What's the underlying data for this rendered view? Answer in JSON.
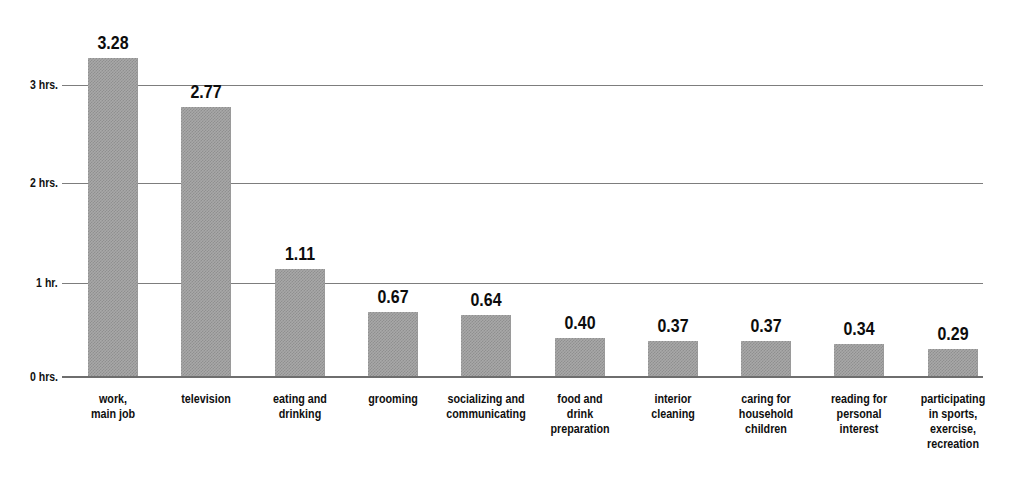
{
  "chart_data": {
    "type": "bar",
    "title": "",
    "subtitle": "",
    "xlabel": "",
    "ylabel": "",
    "grid": true,
    "legend": false,
    "ylim": [
      0,
      3.5
    ],
    "y_tick_values": [
      0,
      1,
      2,
      3
    ],
    "y_tick_labels": [
      "0 hrs.",
      "1 hr.",
      "2 hrs.",
      "3 hrs."
    ],
    "categories": [
      "work,\nmain job",
      "television",
      "eating and\ndrinking",
      "grooming",
      "socializing and\ncommunicating",
      "food and\ndrink\npreparation",
      "interior\ncleaning",
      "caring for\nhousehold\nchildren",
      "reading for\npersonal\ninterest",
      "participating\nin sports,\nexercise,\nrecreation"
    ],
    "values": [
      3.28,
      2.77,
      1.11,
      0.67,
      0.64,
      0.4,
      0.37,
      0.37,
      0.34,
      0.29
    ],
    "value_labels": [
      "3.28",
      "2.77",
      "1.11",
      "0.67",
      "0.64",
      "0.40",
      "0.37",
      "0.37",
      "0.34",
      "0.29"
    ],
    "bar_color": "#a8a8a8",
    "bar_pattern": "50% dither / checkerboard",
    "gridline_color": "#7d7d7d",
    "text_color": "#0f0f0f"
  }
}
